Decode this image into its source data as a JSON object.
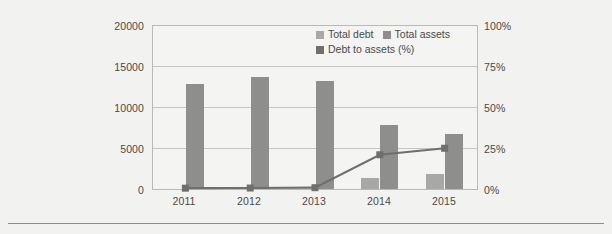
{
  "chart_data": {
    "type": "bar",
    "title": "",
    "xlabel": "",
    "ylabel": "",
    "categories": [
      "2011",
      "2012",
      "2013",
      "2014",
      "2015"
    ],
    "grid": true,
    "legend_position": "top-center",
    "axes": {
      "left": {
        "label": "",
        "ticks": [
          "0",
          "5000",
          "10000",
          "15000",
          "20000"
        ],
        "values": [
          0,
          5000,
          10000,
          15000,
          20000
        ],
        "min": 0,
        "max": 20000
      },
      "right": {
        "label": "",
        "ticks": [
          "0%",
          "25%",
          "50%",
          "75%",
          "100%"
        ],
        "values": [
          0,
          25,
          50,
          75,
          100
        ],
        "min": 0,
        "max": 100
      }
    },
    "series": [
      {
        "name": "Total debt",
        "type": "bar",
        "axis": "left",
        "color": "#a8a8a6",
        "values": [
          0,
          0,
          0,
          1400,
          1900
        ]
      },
      {
        "name": "Total assets",
        "type": "bar",
        "axis": "left",
        "color": "#8e8e8c",
        "values": [
          12850,
          13750,
          13200,
          7800,
          6700
        ]
      },
      {
        "name": "Debt to assets (%)",
        "type": "line",
        "axis": "right",
        "color": "#6f6f6d",
        "values": [
          0.5,
          0.6,
          0.8,
          21.0,
          25.0
        ]
      }
    ]
  },
  "legend": {
    "items": [
      {
        "label": "Total debt",
        "color": "#a8a8a6"
      },
      {
        "label": "Total assets",
        "color": "#8e8e8c"
      },
      {
        "label": "Debt to assets (%)",
        "color": "#6f6f6d"
      }
    ]
  },
  "ticks": {
    "left": [
      "0",
      "5000",
      "10000",
      "15000",
      "20000"
    ],
    "right": [
      "0%",
      "25%",
      "50%",
      "75%",
      "100%"
    ],
    "bottom": [
      "2011",
      "2012",
      "2013",
      "2014",
      "2015"
    ]
  },
  "colors": {
    "background": "#f2f2f0",
    "plot_background": "#f4f4f2",
    "frame": "#b9b9b7",
    "grid": "#c6c6c4",
    "text": "#4a4a48",
    "bar_light": "#a8a8a6",
    "bar_mid": "#8e8e8c",
    "line": "#6f6f6d",
    "rule": "#8d8d8b"
  }
}
